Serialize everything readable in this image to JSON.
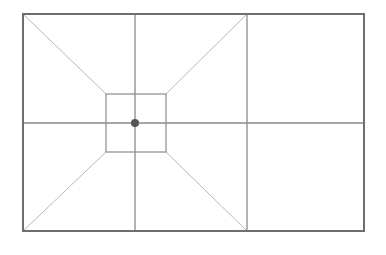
{
  "diagram": {
    "type": "composition-grid",
    "canvas": {
      "width": 386,
      "height": 255,
      "background": "#ffffff"
    },
    "colors": {
      "frame": "#6e6e6e",
      "grid_line": "#8a8a8a",
      "diagonal": "#b8b8b8",
      "inner_square": "#8a8a8a",
      "focus_dot": "#555555"
    },
    "outer_frame": {
      "x": 23,
      "y": 14,
      "width": 341,
      "height": 217
    },
    "vertical_lines": [
      135,
      247
    ],
    "horizontal_lines": [
      123
    ],
    "inner_square": {
      "x": 106,
      "y": 94,
      "width": 60,
      "height": 58
    },
    "diagonals": [
      {
        "x1": 23,
        "y1": 14,
        "x2": 106,
        "y2": 94
      },
      {
        "x1": 247,
        "y1": 14,
        "x2": 166,
        "y2": 94
      },
      {
        "x1": 23,
        "y1": 231,
        "x2": 106,
        "y2": 152
      },
      {
        "x1": 247,
        "y1": 231,
        "x2": 166,
        "y2": 152
      }
    ],
    "focus_point": {
      "cx": 135,
      "cy": 123,
      "r": 4
    }
  }
}
